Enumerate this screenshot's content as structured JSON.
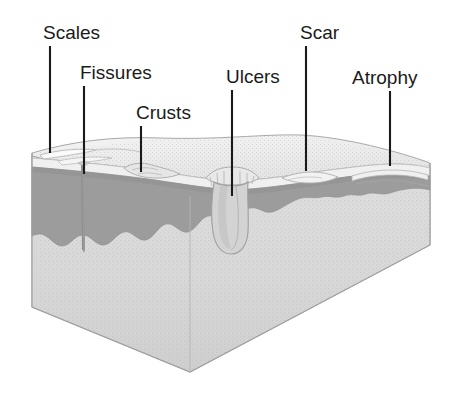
{
  "figure": {
    "background_color": "#ffffff",
    "label_color": "#1a1a1a",
    "leader_line_color": "#1a1a1a"
  },
  "labels": [
    {
      "id": "scales",
      "text": "Scales",
      "text_x": 43,
      "text_y": 39,
      "line_x1": 50,
      "line_y1": 46,
      "line_x2": 50,
      "line_y2": 153
    },
    {
      "id": "fissures",
      "text": "Fissures",
      "text_x": 80,
      "text_y": 79,
      "line_x1": 84,
      "line_y1": 86,
      "line_x2": 84,
      "line_y2": 174
    },
    {
      "id": "crusts",
      "text": "Crusts",
      "text_x": 136,
      "text_y": 119,
      "line_x1": 141,
      "line_y1": 126,
      "line_x2": 141,
      "line_y2": 172
    },
    {
      "id": "ulcers",
      "text": "Ulcers",
      "text_x": 226,
      "text_y": 83,
      "line_x1": 232,
      "line_y1": 90,
      "line_x2": 232,
      "line_y2": 196
    },
    {
      "id": "scar",
      "text": "Scar",
      "text_x": 300,
      "text_y": 39,
      "line_x1": 306,
      "line_y1": 46,
      "line_x2": 306,
      "line_y2": 171
    },
    {
      "id": "atrophy",
      "text": "Atrophy",
      "text_x": 352,
      "text_y": 84,
      "line_x1": 390,
      "line_y1": 91,
      "line_x2": 390,
      "line_y2": 166
    }
  ],
  "skin_block": {
    "layers": [
      {
        "id": "epidermis",
        "name": "epidermis-surface",
        "color": "#efefef"
      },
      {
        "id": "dermis",
        "name": "dermis-band",
        "color": "#9b9b9b"
      },
      {
        "id": "subcutis",
        "name": "subcutaneous-layer",
        "color": "#dcdcdc"
      },
      {
        "id": "front-face",
        "name": "block-front-face",
        "color": "#d6d6d6"
      },
      {
        "id": "right-face",
        "name": "block-right-face",
        "color": "#e2e2e2"
      }
    ],
    "outline_color": "#9a9a9a",
    "features": [
      {
        "id": "scales",
        "name": "scales-flakes"
      },
      {
        "id": "fissures",
        "name": "fissure-cleft"
      },
      {
        "id": "crusts",
        "name": "crust-deposit"
      },
      {
        "id": "ulcers",
        "name": "ulcer-crater"
      },
      {
        "id": "scar",
        "name": "scar-tissue"
      },
      {
        "id": "atrophy",
        "name": "atrophic-thinning"
      }
    ]
  }
}
